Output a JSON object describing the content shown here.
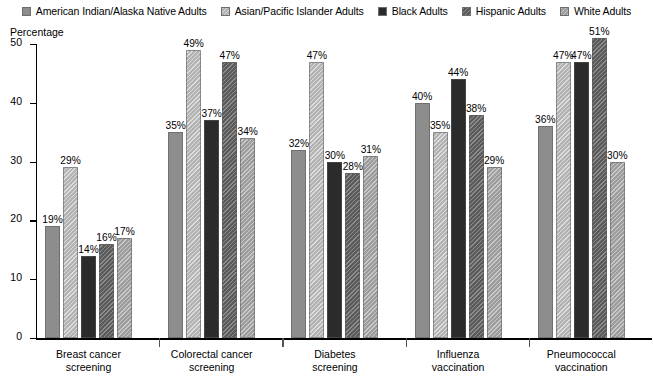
{
  "chart_data": {
    "type": "bar",
    "title": "",
    "xlabel": "",
    "ylabel": "Percentage",
    "ylim": [
      0,
      50
    ],
    "yticks": [
      0,
      10,
      20,
      30,
      40,
      50
    ],
    "grid": false,
    "legend_position": "top-center",
    "value_suffix": "%",
    "categories": [
      "Breast cancer screening",
      "Colorectal cancer screening",
      "Diabetes screening",
      "Influenza vaccination",
      "Pneumococcal vaccination"
    ],
    "category_lines": [
      [
        "Breast cancer",
        "screening"
      ],
      [
        "Colorectal cancer",
        "screening"
      ],
      [
        "Diabetes",
        "screening"
      ],
      [
        "Influenza",
        "vaccination"
      ],
      [
        "Pneumococcal",
        "vaccination"
      ]
    ],
    "series": [
      {
        "name": "American Indian/Alaska Native Adults",
        "color": "#8d8d8d",
        "pattern": "solid",
        "values": [
          19,
          35,
          32,
          40,
          36
        ],
        "labels": [
          "19%",
          "35%",
          "32%",
          "40%",
          "36%"
        ]
      },
      {
        "name": "Asian/Pacific Islander Adults",
        "color": "#b3b3b3",
        "pattern": "diagonal-hatch",
        "values": [
          29,
          49,
          47,
          35,
          47
        ],
        "labels": [
          "29%",
          "49%",
          "47%",
          "35%",
          "47%"
        ]
      },
      {
        "name": "Black Adults",
        "color": "#2b2b2b",
        "pattern": "solid",
        "values": [
          14,
          37,
          30,
          44,
          47
        ],
        "labels": [
          "14%",
          "37%",
          "30%",
          "44%",
          "47%"
        ]
      },
      {
        "name": "Hispanic Adults",
        "color": "#5b5b5b",
        "pattern": "diagonal-hatch",
        "values": [
          16,
          47,
          28,
          38,
          51
        ],
        "labels": [
          "16%",
          "47%",
          "28%",
          "38%",
          "51%"
        ]
      },
      {
        "name": "White Adults",
        "color": "#9d9d9d",
        "pattern": "diagonal-hatch",
        "values": [
          17,
          34,
          31,
          29,
          30
        ],
        "labels": [
          "17%",
          "34%",
          "31%",
          "29%",
          "30%"
        ]
      }
    ]
  },
  "legend": {
    "items": [
      {
        "label": "American Indian/Alaska Native Adults",
        "swatch": "legend-swatch-american-indian"
      },
      {
        "label": "Asian/Pacific Islander Adults",
        "swatch": "legend-swatch-asian-pacific"
      },
      {
        "label": "Black Adults",
        "swatch": "legend-swatch-black"
      },
      {
        "label": "Hispanic Adults",
        "swatch": "legend-swatch-hispanic"
      },
      {
        "label": "White Adults",
        "swatch": "legend-swatch-white"
      }
    ]
  },
  "axis": {
    "y_title": "Percentage",
    "y_tick_labels": [
      "0",
      "10",
      "20",
      "30",
      "40",
      "50"
    ]
  }
}
